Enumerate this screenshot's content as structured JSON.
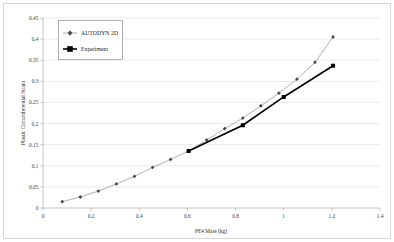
{
  "chart_data": {
    "type": "line",
    "title": "",
    "xlabel": "PE4 Mass (kg)",
    "ylabel": "Plastic Circumferential Strain",
    "xlim": [
      0,
      1.4
    ],
    "ylim": [
      0,
      0.45
    ],
    "grid": true,
    "grid_axis": "y",
    "legend_position": "top-left",
    "xticks": [
      "0",
      "0.2",
      "0.4",
      "0.6",
      "0.8",
      "1",
      "1.2",
      "1.4"
    ],
    "xtick_values": [
      0,
      0.2,
      0.4,
      0.6,
      0.8,
      1.0,
      1.2,
      1.4
    ],
    "yticks": [
      "0",
      "0.05",
      "0.1",
      "0.15",
      "0.2",
      "0.25",
      "0.3",
      "0.35",
      "0.4",
      "0.45"
    ],
    "ytick_values": [
      0,
      0.05,
      0.1,
      0.15,
      0.2,
      0.25,
      0.3,
      0.35,
      0.4,
      0.45
    ],
    "series": [
      {
        "name": "AUTODYN 2D",
        "marker": "diamond",
        "color": "#8c8c8c",
        "x": [
          0.08,
          0.155,
          0.23,
          0.305,
          0.38,
          0.455,
          0.53,
          0.605,
          0.68,
          0.755,
          0.83,
          0.905,
          0.98,
          1.055,
          1.13,
          1.205
        ],
        "y": [
          0.015,
          0.026,
          0.04,
          0.057,
          0.075,
          0.096,
          0.115,
          0.135,
          0.161,
          0.188,
          0.213,
          0.242,
          0.272,
          0.305,
          0.345,
          0.405
        ]
      },
      {
        "name": "Experiment",
        "marker": "square",
        "color": "#000000",
        "x": [
          0.605,
          0.83,
          1.0,
          1.205
        ],
        "y": [
          0.135,
          0.196,
          0.263,
          0.337
        ]
      }
    ]
  },
  "legend": {
    "entries": [
      {
        "label": "AUTODYN 2D"
      },
      {
        "label": "Experiment"
      }
    ]
  },
  "axes": {
    "x_title": "PE4 Mass (kg)",
    "y_title": "Plastic Circumferential Strain"
  }
}
